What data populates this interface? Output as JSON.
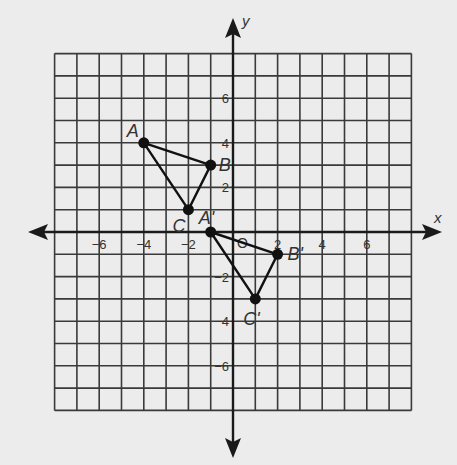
{
  "diagram": {
    "type": "coordinate-plane-transformation",
    "axis_labels": {
      "x": "x",
      "y": "y"
    },
    "grid": {
      "min": -8,
      "max": 8,
      "step": 1
    },
    "x_tick_labels": [
      {
        "value": -6,
        "label": "−6"
      },
      {
        "value": -4,
        "label": "−4"
      },
      {
        "value": -2,
        "label": "−2"
      },
      {
        "value": 2,
        "label": "2"
      },
      {
        "value": 4,
        "label": "4"
      },
      {
        "value": 6,
        "label": "6"
      }
    ],
    "y_tick_labels": [
      {
        "value": 6,
        "label": "6"
      },
      {
        "value": 4,
        "label": "4"
      },
      {
        "value": 2,
        "label": "2"
      },
      {
        "value": -2,
        "label": "−2"
      },
      {
        "value": -4,
        "label": "−4"
      },
      {
        "value": -6,
        "label": "−6"
      }
    ],
    "origin_label": "O",
    "triangles": [
      {
        "name": "ABC",
        "points": [
          {
            "label": "A",
            "x": -4,
            "y": 4
          },
          {
            "label": "B",
            "x": -1,
            "y": 3
          },
          {
            "label": "C",
            "x": -2,
            "y": 1
          }
        ]
      },
      {
        "name": "A'B'C'",
        "points": [
          {
            "label": "A'",
            "x": -1,
            "y": 0
          },
          {
            "label": "B'",
            "x": 2,
            "y": -1
          },
          {
            "label": "C'",
            "x": 1,
            "y": -3
          }
        ]
      }
    ],
    "colors": {
      "background": "#ececec",
      "grid": "#3a3a3a",
      "axis": "#1a1a1a",
      "point": "#111111",
      "text": "#333333"
    }
  }
}
